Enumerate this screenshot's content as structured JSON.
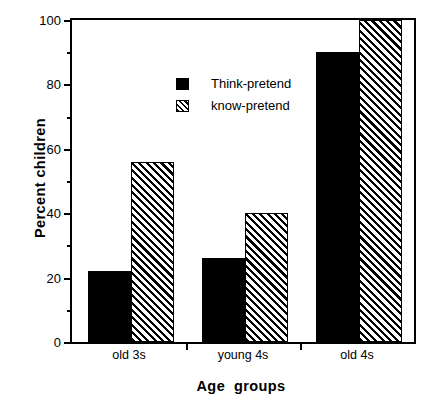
{
  "chart_data": {
    "type": "bar",
    "title": "",
    "xlabel": "Age  groups",
    "ylabel": "Percent children",
    "categories": [
      "old 3s",
      "young 4s",
      "old 4s"
    ],
    "series": [
      {
        "name": "Think-pretend",
        "values": [
          22,
          26,
          90
        ],
        "style": "solid-black"
      },
      {
        "name": "know-pretend",
        "values": [
          56,
          40,
          100
        ],
        "style": "diagonal-hatch"
      }
    ],
    "ylim": [
      0,
      100
    ],
    "ytick_labels": [
      "0",
      "20",
      "40",
      "60",
      "80",
      "100"
    ],
    "ytick_values": [
      0,
      20,
      40,
      60,
      80,
      100
    ],
    "yminor_values": [
      10,
      30,
      50,
      70,
      90
    ],
    "grid": false,
    "legend_position": "upper-left-inside",
    "frame": "box",
    "colors": {
      "series_1": "#000000",
      "series_2_fill": "#ffffff",
      "series_2_hatch": "#000000",
      "axis": "#000000",
      "background": "#ffffff"
    }
  },
  "legend": {
    "items": [
      {
        "label": "Think-pretend",
        "swatch": "solid-black-swatch"
      },
      {
        "label": "know-pretend",
        "swatch": "hatched-swatch"
      }
    ]
  }
}
